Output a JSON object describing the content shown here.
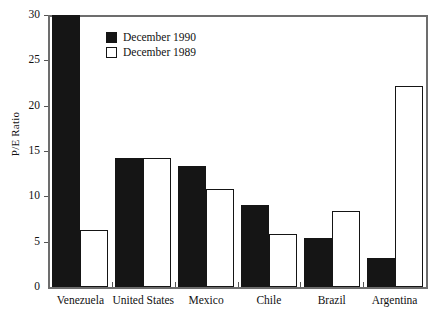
{
  "chart_data": {
    "type": "bar",
    "title": "",
    "subtitle": "",
    "xlabel": "",
    "ylabel": "P/E Ratio",
    "ylim": [
      0,
      30
    ],
    "yticks": [
      0,
      5,
      10,
      15,
      20,
      25,
      30
    ],
    "grid": false,
    "legend_position": "top-left-inside",
    "categories": [
      "Venezuela",
      "United States",
      "Mexico",
      "Chile",
      "Brazil",
      "Argentina"
    ],
    "series": [
      {
        "name": "December 1990",
        "color": "#151515",
        "style": "filled",
        "values": [
          31.5,
          14.2,
          13.3,
          9.1,
          5.4,
          3.2
        ],
        "clipped": [
          true,
          false,
          false,
          false,
          false,
          false
        ]
      },
      {
        "name": "December 1989",
        "color": "#ffffff",
        "style": "hollow",
        "values": [
          6.3,
          14.2,
          10.8,
          5.8,
          8.4,
          22.2
        ],
        "clipped": [
          false,
          false,
          false,
          false,
          false,
          false
        ]
      }
    ]
  },
  "axis": {
    "y_label": "P/E Ratio",
    "y_ticks": [
      "0",
      "5",
      "10",
      "15",
      "20",
      "25",
      "30"
    ]
  },
  "legend": {
    "entries": [
      {
        "label": "December 1990",
        "swatch": "filled-square"
      },
      {
        "label": "December 1989",
        "swatch": "hollow-square"
      }
    ]
  },
  "x_labels": [
    "Venezuela",
    "United States",
    "Mexico",
    "Chile",
    "Brazil",
    "Argentina"
  ]
}
